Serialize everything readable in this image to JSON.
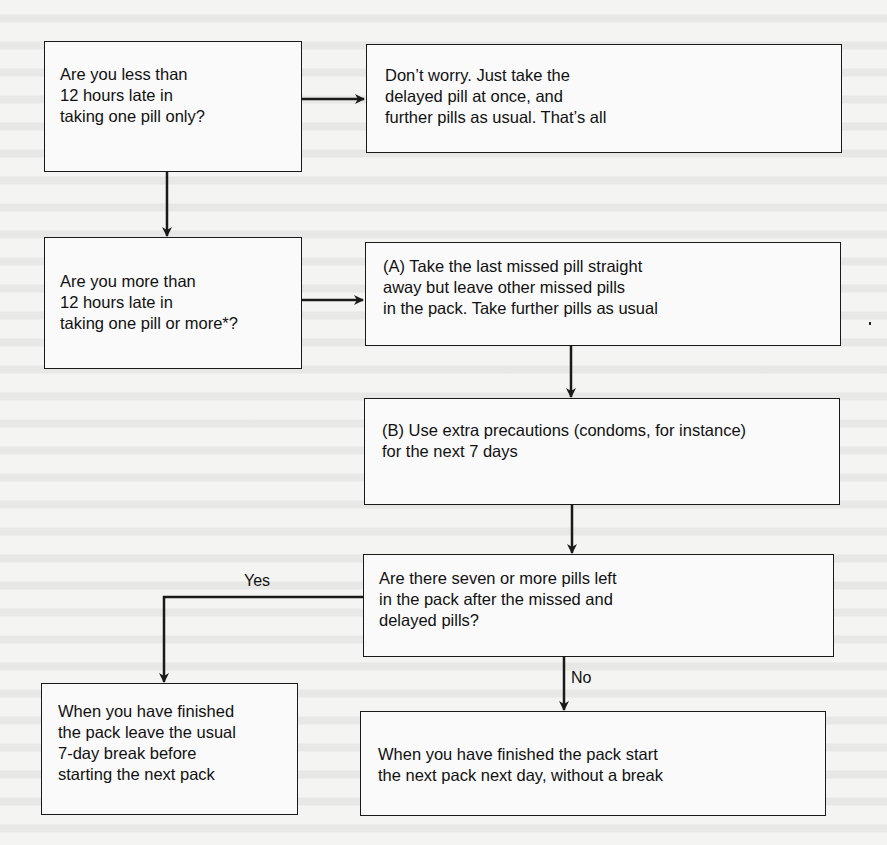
{
  "diagram": {
    "type": "flowchart",
    "nodes": {
      "q1": {
        "lines": [
          "Are you less than",
          "12 hours late in",
          "taking one pill only?"
        ]
      },
      "a1": {
        "lines": [
          "Don’t worry. Just take the",
          "delayed pill at once, and",
          "further pills as usual. That’s all"
        ]
      },
      "q2": {
        "lines": [
          "Are you more than",
          "12 hours late in",
          "taking one pill or more*?"
        ]
      },
      "stepA": {
        "lines": [
          "(A) Take the last missed pill straight",
          "away but leave other missed pills",
          "in the pack. Take further pills as usual"
        ]
      },
      "stepB": {
        "lines": [
          "(B) Use extra precautions (condoms, for instance)",
          "for the next 7 days"
        ]
      },
      "q3": {
        "lines": [
          "Are there seven or more pills left",
          "in the pack after the missed and",
          "delayed pills?"
        ]
      },
      "yesOutcome": {
        "lines": [
          "When you have finished",
          "the pack leave the usual",
          "7-day break before",
          "starting the next pack"
        ]
      },
      "noOutcome": {
        "lines": [
          "When you have finished the pack start",
          "the next pack next day, without a break"
        ]
      }
    },
    "edge_labels": {
      "yes": "Yes",
      "no": "No"
    },
    "edges": [
      {
        "from": "q1",
        "to": "a1"
      },
      {
        "from": "q1",
        "to": "q2"
      },
      {
        "from": "q2",
        "to": "stepA"
      },
      {
        "from": "stepA",
        "to": "stepB"
      },
      {
        "from": "stepB",
        "to": "q3"
      },
      {
        "from": "q3",
        "to": "yesOutcome",
        "label": "Yes"
      },
      {
        "from": "q3",
        "to": "noOutcome",
        "label": "No"
      }
    ],
    "colors": {
      "line": "#1a1a1a",
      "background": "#f4f4f2"
    }
  }
}
